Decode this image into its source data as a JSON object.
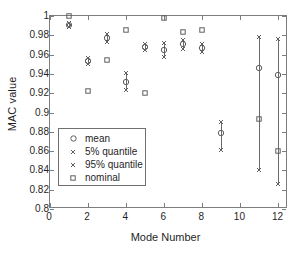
{
  "chart_data": {
    "type": "scatter",
    "title": "",
    "xlabel": "Mode Number",
    "ylabel": "MAC value",
    "xlim": [
      0,
      12.5
    ],
    "ylim": [
      0.8,
      1.0
    ],
    "grid": false,
    "xticks": [
      0,
      2,
      4,
      6,
      8,
      10,
      12
    ],
    "xticklabels": [
      "0",
      "2",
      "4",
      "6",
      "8",
      "10",
      "12"
    ],
    "yticks": [
      0.8,
      0.82,
      0.84,
      0.86,
      0.88,
      0.9,
      0.92,
      0.94,
      0.96,
      0.98,
      1.0
    ],
    "yticklabels": [
      "0.8",
      "0.82",
      "0.84",
      "0.86",
      "0.88",
      "0.9",
      "0.92",
      "0.94",
      "0.96",
      "0.98",
      "1"
    ],
    "legend": {
      "position": "lower-left-inside",
      "entries": [
        {
          "label": "mean",
          "marker": "circle-open"
        },
        {
          "label": "5% quantile",
          "marker": "x-cross"
        },
        {
          "label": "95% quantile",
          "marker": "x-cross"
        },
        {
          "label": "nominal",
          "marker": "square-open"
        }
      ]
    },
    "x": [
      1,
      2,
      3,
      4,
      5,
      6,
      7,
      8,
      9,
      11,
      12
    ],
    "series": [
      {
        "name": "mean",
        "marker": "circle-open",
        "values": [
          0.991,
          0.953,
          0.977,
          0.932,
          0.968,
          0.965,
          0.971,
          0.967,
          0.879,
          0.946,
          0.939
        ]
      },
      {
        "name": "5% quantile",
        "marker": "x-cross",
        "values": [
          0.989,
          0.95,
          0.973,
          0.923,
          0.965,
          0.958,
          0.966,
          0.963,
          0.861,
          0.84,
          0.826
        ]
      },
      {
        "name": "95% quantile",
        "marker": "x-cross",
        "values": [
          0.993,
          0.956,
          0.981,
          0.941,
          0.971,
          0.972,
          0.975,
          0.971,
          0.89,
          0.978,
          0.976
        ]
      },
      {
        "name": "nominal",
        "marker": "square-open",
        "values": [
          1.0,
          0.922,
          0.954,
          0.986,
          0.92,
          0.998,
          0.983,
          0.986,
          null,
          0.893,
          0.86
        ]
      }
    ]
  }
}
